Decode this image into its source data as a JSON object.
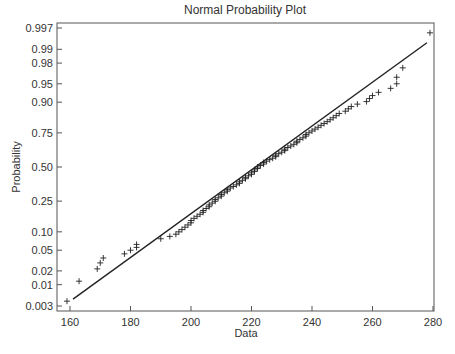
{
  "chart_data": {
    "type": "scatter",
    "title": "Normal Probability Plot",
    "xlabel": "Data",
    "ylabel": "Probability",
    "xlim": [
      156,
      280
    ],
    "x_ticks": [
      160,
      180,
      200,
      220,
      240,
      260,
      280
    ],
    "y_ticks": [
      0.003,
      0.01,
      0.02,
      0.05,
      0.1,
      0.25,
      0.5,
      0.75,
      0.9,
      0.95,
      0.98,
      0.99,
      0.997
    ],
    "y_tick_labels": [
      "0.003",
      "0.01",
      "0.02",
      "0.05",
      "0.10",
      "0.25",
      "0.50",
      "0.75",
      "0.90",
      "0.95",
      "0.98",
      "0.99",
      "0.997"
    ],
    "y_scale": "normal-probability",
    "grid": false,
    "marker": "+",
    "reference_line": {
      "x": [
        161,
        278
      ],
      "p": [
        0.0045,
        0.993
      ]
    },
    "series": [
      {
        "name": "sample",
        "points": [
          [
            159,
            0.004
          ],
          [
            163,
            0.012
          ],
          [
            169,
            0.022
          ],
          [
            170,
            0.029
          ],
          [
            171,
            0.036
          ],
          [
            178,
            0.043
          ],
          [
            180,
            0.05
          ],
          [
            182,
            0.056
          ],
          [
            182,
            0.063
          ],
          [
            190,
            0.078
          ],
          [
            193,
            0.085
          ],
          [
            195,
            0.092
          ],
          [
            196,
            0.1
          ],
          [
            197,
            0.108
          ],
          [
            198,
            0.117
          ],
          [
            199,
            0.126
          ],
          [
            200,
            0.135
          ],
          [
            200,
            0.145
          ],
          [
            201,
            0.155
          ],
          [
            202,
            0.165
          ],
          [
            203,
            0.175
          ],
          [
            204,
            0.185
          ],
          [
            204,
            0.195
          ],
          [
            205,
            0.206
          ],
          [
            206,
            0.216
          ],
          [
            206,
            0.227
          ],
          [
            207,
            0.238
          ],
          [
            208,
            0.249
          ],
          [
            208,
            0.26
          ],
          [
            209,
            0.271
          ],
          [
            210,
            0.282
          ],
          [
            210,
            0.293
          ],
          [
            211,
            0.305
          ],
          [
            212,
            0.316
          ],
          [
            212,
            0.327
          ],
          [
            213,
            0.339
          ],
          [
            214,
            0.35
          ],
          [
            215,
            0.362
          ],
          [
            216,
            0.373
          ],
          [
            216,
            0.385
          ],
          [
            217,
            0.396
          ],
          [
            218,
            0.408
          ],
          [
            218,
            0.419
          ],
          [
            219,
            0.431
          ],
          [
            220,
            0.442
          ],
          [
            220,
            0.454
          ],
          [
            221,
            0.465
          ],
          [
            221,
            0.477
          ],
          [
            222,
            0.488
          ],
          [
            222,
            0.5
          ],
          [
            223,
            0.512
          ],
          [
            224,
            0.523
          ],
          [
            224,
            0.535
          ],
          [
            225,
            0.546
          ],
          [
            226,
            0.558
          ],
          [
            227,
            0.569
          ],
          [
            228,
            0.581
          ],
          [
            228,
            0.592
          ],
          [
            229,
            0.604
          ],
          [
            230,
            0.615
          ],
          [
            231,
            0.627
          ],
          [
            231,
            0.638
          ],
          [
            232,
            0.65
          ],
          [
            233,
            0.661
          ],
          [
            234,
            0.673
          ],
          [
            235,
            0.684
          ],
          [
            235,
            0.695
          ],
          [
            236,
            0.707
          ],
          [
            237,
            0.718
          ],
          [
            238,
            0.729
          ],
          [
            238,
            0.74
          ],
          [
            239,
            0.751
          ],
          [
            240,
            0.762
          ],
          [
            241,
            0.773
          ],
          [
            242,
            0.784
          ],
          [
            243,
            0.795
          ],
          [
            244,
            0.805
          ],
          [
            245,
            0.815
          ],
          [
            246,
            0.825
          ],
          [
            247,
            0.835
          ],
          [
            248,
            0.845
          ],
          [
            249,
            0.855
          ],
          [
            251,
            0.865
          ],
          [
            252,
            0.875
          ],
          [
            253,
            0.884
          ],
          [
            255,
            0.893
          ],
          [
            258,
            0.902
          ],
          [
            259,
            0.912
          ],
          [
            260,
            0.921
          ],
          [
            262,
            0.93
          ],
          [
            266,
            0.94
          ],
          [
            268,
            0.95
          ],
          [
            268,
            0.962
          ],
          [
            270,
            0.975
          ],
          [
            279,
            0.996
          ]
        ]
      }
    ]
  }
}
